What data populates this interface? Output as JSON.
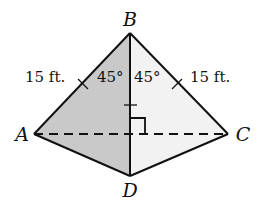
{
  "figure": {
    "vertices": {
      "A": "A",
      "B": "B",
      "C": "C",
      "D": "D"
    },
    "labels": {
      "left_side_length": "15 ft.",
      "right_side_length": "15 ft.",
      "left_angle": "45°",
      "right_angle": "45°"
    },
    "edges": [
      {
        "from": "A",
        "to": "B",
        "style": "solid",
        "tick": true
      },
      {
        "from": "B",
        "to": "C",
        "style": "solid",
        "tick": true
      },
      {
        "from": "A",
        "to": "D",
        "style": "solid",
        "tick": false
      },
      {
        "from": "C",
        "to": "D",
        "style": "solid",
        "tick": false
      },
      {
        "from": "B",
        "to": "D",
        "style": "solid",
        "tick": true
      },
      {
        "from": "A",
        "to": "C",
        "style": "dashed",
        "tick": false
      }
    ],
    "right_angle_marker": {
      "at": "intersection of BD and AC"
    },
    "colors": {
      "shaded_face": "#c9c9c9",
      "light_face": "#f2f2f2",
      "stroke": "#111111"
    }
  }
}
